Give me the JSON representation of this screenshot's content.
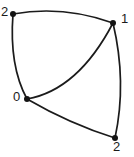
{
  "diagram": {
    "type": "curved-quadrilateral-graph",
    "width": 134,
    "height": 157,
    "background_color": "#ffffff",
    "stroke_color": "#1b1b1b",
    "vertex_color": "#141414",
    "vertices": [
      {
        "id": "v2tl",
        "label": "2",
        "x": 13,
        "y": 14,
        "label_x": 1,
        "label_y": 5
      },
      {
        "id": "v1tr",
        "label": "1",
        "x": 113,
        "y": 23,
        "label_x": 121,
        "label_y": 12
      },
      {
        "id": "v0",
        "label": "0",
        "x": 27,
        "y": 99,
        "label_x": 13,
        "label_y": 90
      },
      {
        "id": "v2br",
        "label": "2",
        "x": 115,
        "y": 138,
        "label_x": 113,
        "label_y": 140
      }
    ],
    "edges": [
      {
        "id": "edge-top",
        "from": "v2tl",
        "to": "v1tr",
        "curve": "arcs-upward",
        "path": "M 13 14 Q 63 5 113 23"
      },
      {
        "id": "edge-left",
        "from": "v2tl",
        "to": "v0",
        "curve": "bows-left",
        "path": "M 13 14 Q 9 66 27 99"
      },
      {
        "id": "edge-right",
        "from": "v1tr",
        "to": "v2br",
        "curve": "bows-right",
        "path": "M 113 23 Q 127 82 115 138"
      },
      {
        "id": "edge-bottom",
        "from": "v0",
        "to": "v2br",
        "curve": "sags-downward",
        "path": "M 27 99 Q 70 124 115 138"
      },
      {
        "id": "edge-diagonal",
        "from": "v0",
        "to": "v1tr",
        "curve": "bows-downright",
        "path": "M 27 99 Q 78 90 113 23"
      }
    ]
  }
}
